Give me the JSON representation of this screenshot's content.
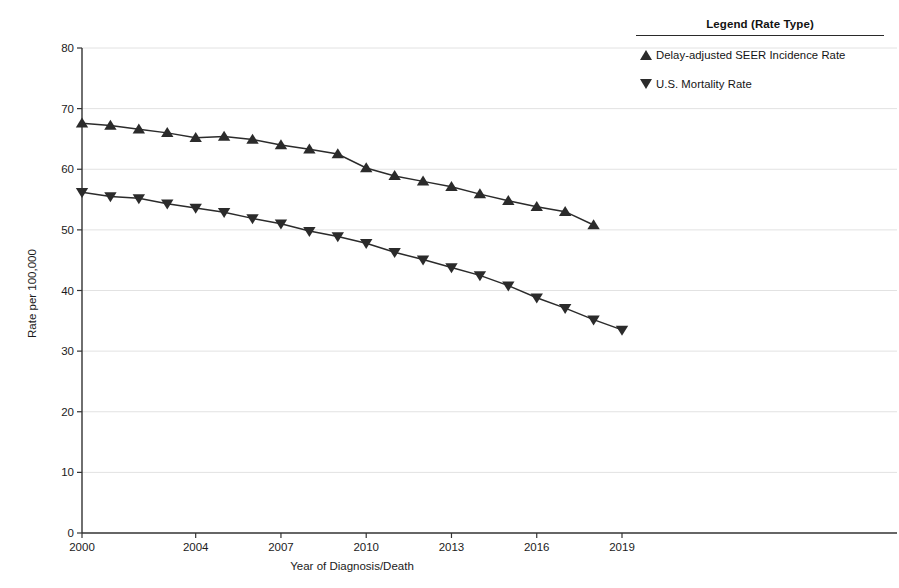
{
  "chart_data": {
    "type": "line",
    "title": "",
    "xlabel": "Year of Diagnosis/Death",
    "ylabel": "Rate per 100,000",
    "xlim": [
      2000,
      2019
    ],
    "ylim": [
      0,
      80
    ],
    "ytick_step": 10,
    "yticks": [
      "0",
      "10",
      "20",
      "30",
      "40",
      "50",
      "60",
      "70",
      "80"
    ],
    "xticks": [
      "2000",
      "2004",
      "2007",
      "2010",
      "2013",
      "2016",
      "2019"
    ],
    "grid": true,
    "legend_position": "right",
    "legend_title": "Legend (Rate Type)",
    "x": [
      2000,
      2001,
      2002,
      2003,
      2004,
      2005,
      2006,
      2007,
      2008,
      2009,
      2010,
      2011,
      2012,
      2013,
      2014,
      2015,
      2016,
      2017,
      2018,
      2019
    ],
    "series": [
      {
        "name": "Delay-adjusted SEER Incidence Rate",
        "marker": "triangle-up",
        "color": "#2b2b2b",
        "x": [
          2000,
          2001,
          2002,
          2003,
          2004,
          2005,
          2006,
          2007,
          2008,
          2009,
          2010,
          2011,
          2012,
          2013,
          2014,
          2015,
          2016,
          2017,
          2018
        ],
        "values": [
          67.6,
          67.2,
          66.6,
          66.0,
          65.2,
          65.4,
          64.9,
          64.0,
          63.3,
          62.5,
          60.2,
          58.9,
          58.0,
          57.1,
          55.9,
          54.8,
          53.8,
          53.0,
          50.8
        ]
      },
      {
        "name": "U.S. Mortality Rate",
        "marker": "triangle-down",
        "color": "#2b2b2b",
        "x": [
          2000,
          2001,
          2002,
          2003,
          2004,
          2005,
          2006,
          2007,
          2008,
          2009,
          2010,
          2011,
          2012,
          2013,
          2014,
          2015,
          2016,
          2017,
          2018,
          2019
        ],
        "values": [
          56.2,
          55.5,
          55.2,
          54.3,
          53.6,
          52.9,
          51.9,
          51.0,
          49.8,
          48.9,
          47.8,
          46.3,
          45.1,
          43.8,
          42.5,
          40.8,
          38.8,
          37.1,
          35.2,
          33.5
        ]
      }
    ]
  },
  "legend": {
    "title": "Legend (Rate Type)",
    "entries": [
      {
        "label": "Delay-adjusted SEER Incidence Rate",
        "marker": "triangle-up-icon"
      },
      {
        "label": "U.S. Mortality Rate",
        "marker": "triangle-down-icon"
      }
    ]
  },
  "axes": {
    "x_title": "Year of Diagnosis/Death",
    "y_title": "Rate per 100,000"
  }
}
